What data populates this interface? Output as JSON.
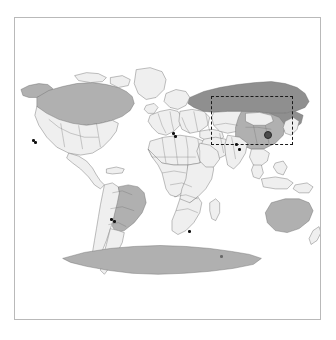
{
  "figure": {
    "title": "",
    "frame_color": "#b9b9b9",
    "background_color": "#ffffff"
  },
  "map": {
    "projection": "robinson",
    "ocean_color": "#ffffff",
    "country_border_color": "#6e6e6e",
    "shading_legend": [
      {
        "key": "highlight-dark",
        "color": "#8f8f8f",
        "label": "Russia"
      },
      {
        "key": "shaded-medium",
        "color": "#b0b0b0",
        "label": "Canada / Brazil / Australia / Antarctica / China"
      },
      {
        "key": "unshaded-light",
        "color": "#efefef",
        "label": "Other countries"
      }
    ],
    "regions": [
      {
        "name": "russia",
        "shade": "highlight-dark"
      },
      {
        "name": "canada",
        "shade": "shaded-medium"
      },
      {
        "name": "united-states",
        "shade": "unshaded-light"
      },
      {
        "name": "brazil",
        "shade": "shaded-medium"
      },
      {
        "name": "australia",
        "shade": "shaded-medium"
      },
      {
        "name": "antarctica",
        "shade": "shaded-medium"
      },
      {
        "name": "china",
        "shade": "shaded-medium"
      },
      {
        "name": "africa",
        "shade": "unshaded-light"
      },
      {
        "name": "europe",
        "shade": "unshaded-light"
      },
      {
        "name": "greenland",
        "shade": "unshaded-light"
      }
    ]
  },
  "roi": {
    "label": "",
    "style": "dashed",
    "color": "#1a1a1a",
    "x": 196,
    "y": 78,
    "width": 82,
    "height": 49
  },
  "markers": {
    "focus": {
      "name": "china-focus-marker",
      "color": "#4c4c4c",
      "x": 249,
      "y": 113
    },
    "points": [
      {
        "name": "marker-north-america-west",
        "x": 17,
        "y": 121
      },
      {
        "name": "marker-north-america-west-2",
        "x": 19,
        "y": 123
      },
      {
        "name": "marker-europe-italy",
        "x": 157,
        "y": 114
      },
      {
        "name": "marker-europe-italy-2",
        "x": 159,
        "y": 117
      },
      {
        "name": "marker-south-asia",
        "x": 220,
        "y": 125
      },
      {
        "name": "marker-southeast-asia",
        "x": 223,
        "y": 130
      },
      {
        "name": "marker-south-america-brazil",
        "x": 95,
        "y": 200
      },
      {
        "name": "marker-south-america-brazil-2",
        "x": 98,
        "y": 202
      },
      {
        "name": "marker-africa-south",
        "x": 173,
        "y": 212
      },
      {
        "name": "marker-indian-ocean",
        "x": 205,
        "y": 237
      }
    ]
  }
}
